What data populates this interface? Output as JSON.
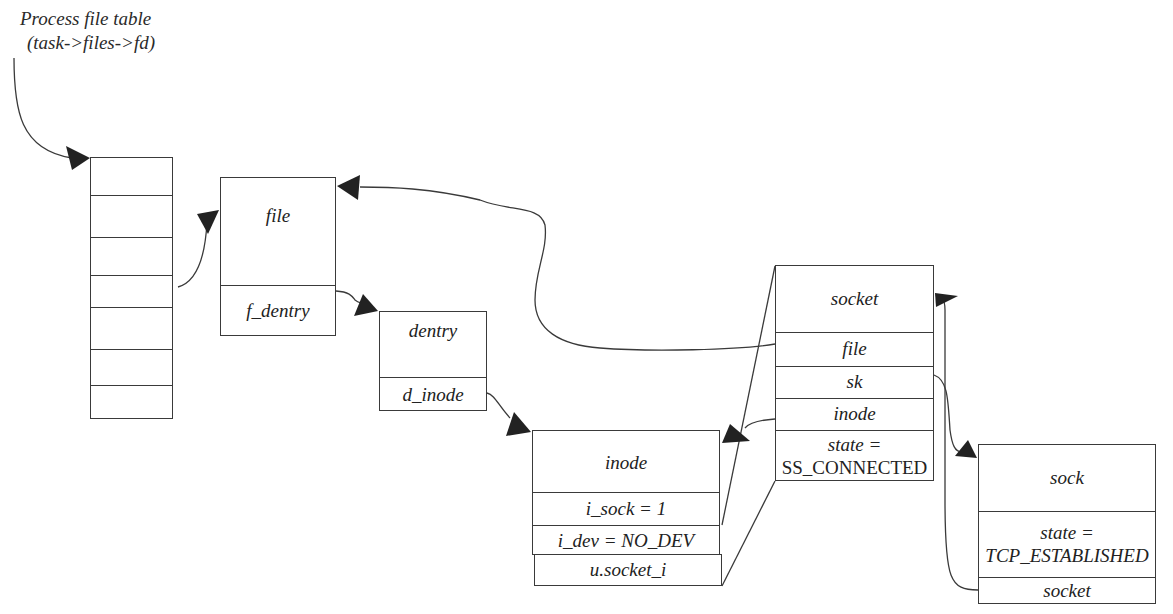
{
  "caption": {
    "line1": "Process file table",
    "line2": "(task->files->fd)"
  },
  "fd_table": {
    "slot_count": 7
  },
  "file": {
    "title": "file",
    "fields": [
      "f_dentry"
    ]
  },
  "dentry": {
    "title": "dentry",
    "fields": [
      "d_inode"
    ]
  },
  "inode": {
    "title": "inode",
    "fields": [
      "i_sock = 1",
      "i_dev = NO_DEV",
      "u.socket_i"
    ]
  },
  "socket": {
    "title": "socket",
    "fields": [
      "file",
      "sk",
      "inode",
      "state =\nSS_CONNECTED"
    ],
    "state_line1": "state =",
    "state_line2": "SS_CONNECTED"
  },
  "sock": {
    "title": "sock",
    "state_line1": "state =",
    "state_line2": "TCP_ESTABLISHED",
    "fields": [
      "state =\nTCP_ESTABLISHED",
      "socket"
    ],
    "socket_field": "socket"
  },
  "colors": {
    "line": "#3a3a3a",
    "arrow": "#222222",
    "background": "#ffffff"
  }
}
